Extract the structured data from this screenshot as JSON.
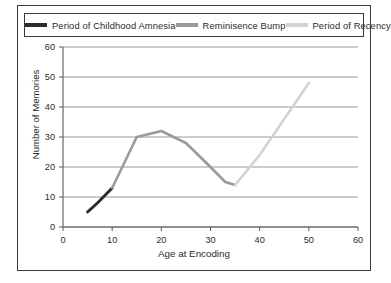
{
  "chart_data": {
    "type": "line",
    "title": "",
    "xlabel": "Age at Encoding",
    "ylabel": "Number of Memories",
    "xlim": [
      0,
      60
    ],
    "ylim": [
      0,
      60
    ],
    "xticks": [
      0,
      10,
      20,
      30,
      40,
      50,
      60
    ],
    "yticks": [
      0,
      10,
      20,
      30,
      40,
      50,
      60
    ],
    "grid": "horizontal",
    "legend_position": "top",
    "series": [
      {
        "name": "Period of Childhood Amnesia",
        "color": "#2b2b2b",
        "points": [
          [
            5,
            5
          ],
          [
            7,
            8
          ],
          [
            10,
            13
          ]
        ]
      },
      {
        "name": "Reminisence Bump",
        "color": "#9a9a9a",
        "points": [
          [
            10,
            13
          ],
          [
            15,
            30
          ],
          [
            20,
            32
          ],
          [
            25,
            28
          ],
          [
            30,
            20
          ],
          [
            33,
            15
          ],
          [
            35,
            14
          ]
        ]
      },
      {
        "name": "Period of Recency",
        "color": "#d3d3d3",
        "points": [
          [
            35,
            14
          ],
          [
            40,
            24
          ],
          [
            45,
            36
          ],
          [
            50,
            48
          ]
        ]
      }
    ]
  },
  "legend": {
    "items": [
      {
        "label": "Period of Childhood Amnesia",
        "color": "#2b2b2b"
      },
      {
        "label": "Reminisence Bump",
        "color": "#9a9a9a"
      },
      {
        "label": "Period of Recency",
        "color": "#d3d3d3"
      }
    ]
  },
  "axes": {
    "x_title": "Age at Encoding",
    "y_title": "Number of Memories",
    "x_tick_labels": [
      "0",
      "10",
      "20",
      "30",
      "40",
      "50",
      "60"
    ],
    "y_tick_labels": [
      "0",
      "10",
      "20",
      "30",
      "40",
      "50",
      "60"
    ]
  }
}
